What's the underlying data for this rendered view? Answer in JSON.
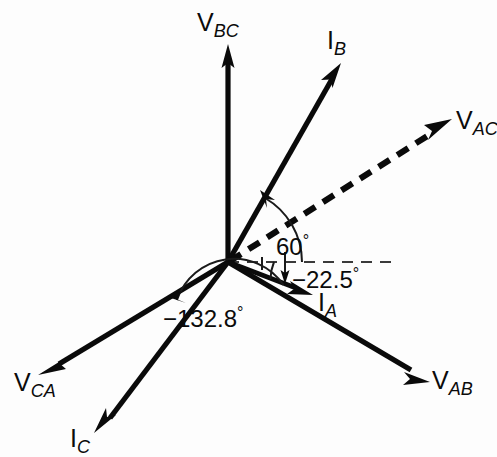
{
  "figure": {
    "type": "phasor-diagram",
    "title": "",
    "background_color": "#fdfdfd",
    "stroke_color": "#0a0a0a",
    "origin": {
      "x": 228,
      "y": 262
    }
  },
  "reference_line": {
    "name": "horizontal-reference-axis",
    "style": "dashed",
    "angle_deg": 0,
    "from": {
      "x": 228,
      "y": 262
    },
    "to": {
      "x": 392,
      "y": 262
    }
  },
  "phasors": [
    {
      "id": "v-bc",
      "label_base": "V",
      "label_sub": "BC",
      "kind": "voltage",
      "style": "solid",
      "angle_deg": 90,
      "tip": {
        "x": 228,
        "y": 48
      },
      "label_pos": {
        "x": 197,
        "y": 10
      }
    },
    {
      "id": "i-b",
      "label_base": "I",
      "label_sub": "B",
      "kind": "current",
      "style": "solid",
      "angle_deg": 60,
      "tip": {
        "x": 338,
        "y": 68
      },
      "label_pos": {
        "x": 327,
        "y": 28
      }
    },
    {
      "id": "v-ac",
      "label_base": "V",
      "label_sub": "AC",
      "kind": "voltage",
      "style": "dashed",
      "angle_deg": 30,
      "tip": {
        "x": 449,
        "y": 122
      },
      "label_pos": {
        "x": 456,
        "y": 108
      }
    },
    {
      "id": "i-a",
      "label_base": "I",
      "label_sub": "A",
      "kind": "current",
      "style": "solid",
      "angle_deg": -22.5,
      "tip": {
        "x": 310,
        "y": 293
      },
      "label_pos": {
        "x": 318,
        "y": 290
      }
    },
    {
      "id": "v-ab",
      "label_base": "V",
      "label_sub": "AB",
      "kind": "voltage",
      "style": "solid",
      "angle_deg": -30,
      "tip": {
        "x": 427,
        "y": 379
      },
      "label_pos": {
        "x": 432,
        "y": 368
      }
    },
    {
      "id": "v-ca",
      "label_base": "V",
      "label_sub": "CA",
      "kind": "voltage",
      "style": "solid",
      "angle_deg": 210,
      "tip": {
        "x": 40,
        "y": 371
      },
      "label_pos": {
        "x": 14,
        "y": 370
      }
    },
    {
      "id": "i-c",
      "label_base": "I",
      "label_sub": "C",
      "kind": "current",
      "style": "solid",
      "angle_deg": 237.5,
      "tip": {
        "x": 96,
        "y": 431
      },
      "label_pos": {
        "x": 70,
        "y": 426
      }
    }
  ],
  "angle_marks": [
    {
      "id": "angle-60",
      "value_text": "60",
      "degree_symbol": "°",
      "value_deg": 60,
      "from_deg": 0,
      "to_deg": 60,
      "radius": 74,
      "label_pos": {
        "x": 276,
        "y": 233
      },
      "arrow_end": "to"
    },
    {
      "id": "angle-minus-22-5",
      "value_text": "−22.5",
      "degree_symbol": "°",
      "value_deg": -22.5,
      "from_deg": 0,
      "to_deg": -22.5,
      "radius": 46,
      "label_pos": {
        "x": 283,
        "y": 264
      },
      "arrow_end": "to"
    },
    {
      "id": "angle-minus-132-8",
      "value_text": "−132.8",
      "degree_symbol": "°",
      "value_deg": -132.8,
      "from_deg": -22.5,
      "to_deg": -132.8,
      "radius": 60,
      "label_pos": {
        "x": 171,
        "y": 305
      },
      "arrow_end": "to"
    }
  ]
}
